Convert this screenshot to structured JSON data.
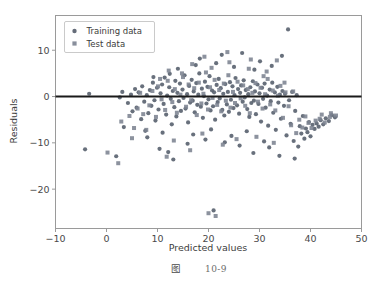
{
  "figure": {
    "caption_label": "图",
    "caption_number": "10-9",
    "background_color": "#ffffff"
  },
  "chart_data": {
    "type": "scatter",
    "title": "",
    "xlabel": "Predicted values",
    "ylabel": "Residuals",
    "xlim": [
      -10,
      50
    ],
    "ylim": [
      -28.5,
      17.5
    ],
    "xticks": [
      -10,
      0,
      10,
      20,
      30,
      40,
      50
    ],
    "xticklabels": [
      "−10",
      "0",
      "10",
      "20",
      "30",
      "40",
      "50"
    ],
    "yticks": [
      10,
      0,
      -10,
      -20
    ],
    "yticklabels": [
      "10",
      "0",
      "−10",
      "−20"
    ],
    "grid": false,
    "legend_position": "upper left",
    "reference_line": {
      "orientation": "horizontal",
      "y": 0,
      "color": "#1a1a1a",
      "width": 2
    },
    "series": [
      {
        "name": "Training data",
        "marker": "circle",
        "color": "#58606e",
        "size": 4.2,
        "points": [
          [
            -4.2,
            -11.4
          ],
          [
            -3.4,
            0.6
          ],
          [
            1.9,
            -12.9
          ],
          [
            2.6,
            -0.2
          ],
          [
            3.1,
            1.0
          ],
          [
            3.4,
            -6.6
          ],
          [
            4.2,
            -1.4
          ],
          [
            4.8,
            0.4
          ],
          [
            5.1,
            -3.2
          ],
          [
            5.6,
            1.6
          ],
          [
            5.9,
            -2.4
          ],
          [
            6.3,
            0.9
          ],
          [
            6.8,
            -4.9
          ],
          [
            7.0,
            2.2
          ],
          [
            7.4,
            -1.1
          ],
          [
            7.6,
            -7.4
          ],
          [
            7.9,
            0.3
          ],
          [
            8.2,
            -3.6
          ],
          [
            8.5,
            1.4
          ],
          [
            8.8,
            -2.0
          ],
          [
            9.1,
            3.0
          ],
          [
            9.4,
            -0.8
          ],
          [
            9.6,
            -5.2
          ],
          [
            9.9,
            1.9
          ],
          [
            10.2,
            -2.8
          ],
          [
            10.4,
            -11.3
          ],
          [
            10.6,
            0.7
          ],
          [
            10.9,
            2.6
          ],
          [
            11.2,
            -1.6
          ],
          [
            11.4,
            4.1
          ],
          [
            11.7,
            -3.9
          ],
          [
            11.9,
            0.2
          ],
          [
            12.1,
            -12.0
          ],
          [
            12.3,
            2.0
          ],
          [
            12.6,
            -0.5
          ],
          [
            12.8,
            -6.0
          ],
          [
            13.0,
            1.2
          ],
          [
            13.3,
            -2.3
          ],
          [
            13.5,
            3.4
          ],
          [
            13.7,
            -4.3
          ],
          [
            13.9,
            0.8
          ],
          [
            14.2,
            -1.0
          ],
          [
            14.4,
            2.8
          ],
          [
            14.6,
            -3.1
          ],
          [
            14.9,
            1.5
          ],
          [
            15.1,
            -0.3
          ],
          [
            15.3,
            4.6
          ],
          [
            15.5,
            -2.6
          ],
          [
            15.8,
            0.5
          ],
          [
            16.0,
            -5.6
          ],
          [
            16.2,
            2.3
          ],
          [
            16.4,
            -1.3
          ],
          [
            16.7,
            3.6
          ],
          [
            16.9,
            -0.9
          ],
          [
            17.1,
            1.1
          ],
          [
            17.3,
            -3.4
          ],
          [
            17.6,
            2.9
          ],
          [
            17.8,
            -1.8
          ],
          [
            18.0,
            0.4
          ],
          [
            18.2,
            5.0
          ],
          [
            18.5,
            -2.2
          ],
          [
            18.7,
            1.7
          ],
          [
            18.9,
            -4.6
          ],
          [
            19.1,
            0.1
          ],
          [
            19.3,
            3.2
          ],
          [
            19.6,
            -1.5
          ],
          [
            19.8,
            2.1
          ],
          [
            20.0,
            -0.6
          ],
          [
            20.2,
            4.4
          ],
          [
            20.4,
            -3.0
          ],
          [
            20.7,
            1.3
          ],
          [
            20.9,
            -2.1
          ],
          [
            21.1,
            0.9
          ],
          [
            21.3,
            -5.0
          ],
          [
            21.6,
            2.5
          ],
          [
            21.8,
            -1.2
          ],
          [
            22.0,
            3.8
          ],
          [
            22.2,
            -0.4
          ],
          [
            22.4,
            1.8
          ],
          [
            22.7,
            -2.9
          ],
          [
            22.9,
            0.6
          ],
          [
            23.1,
            -4.1
          ],
          [
            23.3,
            2.7
          ],
          [
            23.6,
            -1.7
          ],
          [
            23.8,
            1.0
          ],
          [
            24.0,
            -3.3
          ],
          [
            24.2,
            3.1
          ],
          [
            24.4,
            -0.7
          ],
          [
            24.7,
            2.2
          ],
          [
            24.9,
            -2.5
          ],
          [
            25.1,
            0.3
          ],
          [
            25.3,
            4.0
          ],
          [
            25.6,
            -1.9
          ],
          [
            25.8,
            1.6
          ],
          [
            26.0,
            -3.7
          ],
          [
            26.2,
            0.8
          ],
          [
            26.4,
            2.4
          ],
          [
            26.7,
            -1.1
          ],
          [
            26.9,
            3.5
          ],
          [
            27.1,
            -0.2
          ],
          [
            27.3,
            1.4
          ],
          [
            27.6,
            -2.7
          ],
          [
            27.8,
            0.5
          ],
          [
            28.0,
            -4.4
          ],
          [
            28.2,
            2.0
          ],
          [
            28.4,
            -1.4
          ],
          [
            28.7,
            3.3
          ],
          [
            28.9,
            -0.9
          ],
          [
            29.1,
            1.1
          ],
          [
            29.3,
            -3.8
          ],
          [
            29.6,
            2.6
          ],
          [
            29.8,
            -1.6
          ],
          [
            30.0,
            0.7
          ],
          [
            30.3,
            -5.4
          ],
          [
            30.5,
            1.9
          ],
          [
            30.7,
            -0.5
          ],
          [
            31.0,
            2.8
          ],
          [
            31.2,
            -2.4
          ],
          [
            31.5,
            0.2
          ],
          [
            31.7,
            -6.3
          ],
          [
            32.0,
            1.5
          ],
          [
            32.2,
            -1.0
          ],
          [
            32.5,
            3.0
          ],
          [
            32.7,
            -3.5
          ],
          [
            33.0,
            0.9
          ],
          [
            33.2,
            -7.2
          ],
          [
            33.5,
            2.1
          ],
          [
            33.7,
            -1.3
          ],
          [
            34.0,
            0.4
          ],
          [
            34.2,
            -4.8
          ],
          [
            34.5,
            1.2
          ],
          [
            34.8,
            -2.0
          ],
          [
            35.0,
            0.6
          ],
          [
            35.3,
            -8.4
          ],
          [
            35.6,
            14.5
          ],
          [
            35.8,
            -0.8
          ],
          [
            36.1,
            -5.9
          ],
          [
            36.4,
            1.0
          ],
          [
            36.7,
            -9.6
          ],
          [
            37.0,
            -3.1
          ],
          [
            37.3,
            0.3
          ],
          [
            37.6,
            -10.8
          ],
          [
            37.9,
            -6.4
          ],
          [
            38.2,
            -8.0
          ],
          [
            38.5,
            -4.2
          ],
          [
            38.8,
            -9.1
          ],
          [
            39.1,
            -6.9
          ],
          [
            39.4,
            -7.7
          ],
          [
            39.7,
            -5.5
          ],
          [
            40.0,
            -8.6
          ],
          [
            40.4,
            -6.1
          ],
          [
            40.8,
            -7.0
          ],
          [
            41.2,
            -5.8
          ],
          [
            41.6,
            -6.5
          ],
          [
            42.0,
            -5.1
          ],
          [
            42.5,
            -6.0
          ],
          [
            43.0,
            -4.7
          ],
          [
            43.6,
            -5.3
          ],
          [
            44.2,
            -4.0
          ],
          [
            44.8,
            -4.5
          ],
          [
            13.1,
            -13.6
          ],
          [
            15.9,
            -10.2
          ],
          [
            19.4,
            -9.3
          ],
          [
            23.2,
            -9.9
          ],
          [
            26.1,
            -10.6
          ],
          [
            28.8,
            -12.2
          ],
          [
            31.9,
            -11.0
          ],
          [
            21.0,
            -24.6
          ],
          [
            8.0,
            -8.8
          ],
          [
            11.0,
            -7.8
          ],
          [
            17.0,
            -8.2
          ],
          [
            20.5,
            -7.1
          ],
          [
            24.5,
            -8.5
          ],
          [
            27.5,
            -7.5
          ],
          [
            30.9,
            -9.7
          ],
          [
            33.9,
            -12.8
          ],
          [
            36.9,
            -13.4
          ],
          [
            14.0,
            6.0
          ],
          [
            17.5,
            6.8
          ],
          [
            21.5,
            7.2
          ],
          [
            25.0,
            6.4
          ],
          [
            29.0,
            5.8
          ],
          [
            32.4,
            6.6
          ],
          [
            34.4,
            8.8
          ],
          [
            22.6,
            9.0
          ],
          [
            18.3,
            8.2
          ],
          [
            26.6,
            9.4
          ],
          [
            30.1,
            7.6
          ],
          [
            12.4,
            4.9
          ],
          [
            9.2,
            4.2
          ]
        ]
      },
      {
        "name": "Test data",
        "marker": "square",
        "color": "#7c8391",
        "size": 4.0,
        "points": [
          [
            0.2,
            -12.1
          ],
          [
            2.9,
            -5.4
          ],
          [
            4.5,
            -4.2
          ],
          [
            5.4,
            -6.8
          ],
          [
            6.1,
            -2.6
          ],
          [
            6.6,
            0.8
          ],
          [
            7.2,
            -3.8
          ],
          [
            8.4,
            -1.9
          ],
          [
            9.0,
            1.2
          ],
          [
            9.7,
            -4.4
          ],
          [
            10.1,
            2.2
          ],
          [
            10.8,
            -0.6
          ],
          [
            11.5,
            -2.9
          ],
          [
            12.0,
            3.4
          ],
          [
            12.9,
            -1.2
          ],
          [
            13.4,
            1.6
          ],
          [
            13.8,
            -3.5
          ],
          [
            14.5,
            0.4
          ],
          [
            15.0,
            4.2
          ],
          [
            15.6,
            -2.2
          ],
          [
            16.1,
            2.6
          ],
          [
            16.6,
            -0.8
          ],
          [
            17.2,
            1.8
          ],
          [
            17.7,
            -4.0
          ],
          [
            18.1,
            3.0
          ],
          [
            18.6,
            -1.5
          ],
          [
            19.0,
            0.6
          ],
          [
            19.5,
            5.2
          ],
          [
            19.9,
            -2.8
          ],
          [
            20.3,
            2.0
          ],
          [
            20.8,
            -0.3
          ],
          [
            21.2,
            3.6
          ],
          [
            21.7,
            -1.8
          ],
          [
            22.1,
            1.4
          ],
          [
            22.5,
            -3.2
          ],
          [
            23.0,
            2.8
          ],
          [
            23.4,
            -0.9
          ],
          [
            23.9,
            4.6
          ],
          [
            24.3,
            -2.4
          ],
          [
            24.8,
            1.0
          ],
          [
            25.2,
            -1.4
          ],
          [
            25.7,
            3.2
          ],
          [
            26.3,
            -0.4
          ],
          [
            26.8,
            2.4
          ],
          [
            27.2,
            -2.0
          ],
          [
            27.7,
            1.6
          ],
          [
            28.1,
            -3.6
          ],
          [
            28.6,
            0.8
          ],
          [
            29.2,
            2.9
          ],
          [
            29.7,
            -1.1
          ],
          [
            30.2,
            1.9
          ],
          [
            30.6,
            -2.6
          ],
          [
            31.1,
            0.5
          ],
          [
            31.6,
            3.8
          ],
          [
            32.1,
            -1.7
          ],
          [
            32.6,
            1.3
          ],
          [
            33.1,
            -3.0
          ],
          [
            33.6,
            0.2
          ],
          [
            34.1,
            2.3
          ],
          [
            34.6,
            -4.6
          ],
          [
            35.1,
            0.9
          ],
          [
            35.7,
            -2.1
          ],
          [
            36.2,
            -6.2
          ],
          [
            36.6,
            1.1
          ],
          [
            37.2,
            -7.9
          ],
          [
            37.8,
            -5.0
          ],
          [
            38.4,
            -6.7
          ],
          [
            39.0,
            -4.3
          ],
          [
            39.6,
            -5.7
          ],
          [
            40.2,
            -6.8
          ],
          [
            41.0,
            -5.2
          ],
          [
            41.8,
            -4.8
          ],
          [
            42.8,
            -5.6
          ],
          [
            43.8,
            -4.4
          ],
          [
            45.0,
            -4.1
          ],
          [
            2.3,
            -14.4
          ],
          [
            11.8,
            -13.0
          ],
          [
            16.4,
            -11.6
          ],
          [
            22.8,
            -10.4
          ],
          [
            20.0,
            -25.2
          ],
          [
            21.4,
            -25.8
          ],
          [
            5.0,
            -9.0
          ],
          [
            7.8,
            -7.2
          ],
          [
            13.2,
            -9.5
          ],
          [
            18.8,
            -8.0
          ],
          [
            25.5,
            -9.2
          ],
          [
            29.4,
            -8.7
          ],
          [
            32.8,
            -10.0
          ],
          [
            12.2,
            5.6
          ],
          [
            16.8,
            7.0
          ],
          [
            20.6,
            6.2
          ],
          [
            24.1,
            7.4
          ],
          [
            27.9,
            6.0
          ],
          [
            31.4,
            5.4
          ],
          [
            33.4,
            7.8
          ],
          [
            23.7,
            9.6
          ],
          [
            19.2,
            8.6
          ],
          [
            28.3,
            8.0
          ],
          [
            14.8,
            5.0
          ],
          [
            10.5,
            3.8
          ],
          [
            30.8,
            4.4
          ],
          [
            34.9,
            3.0
          ],
          [
            44.0,
            -3.6
          ],
          [
            42.2,
            -3.9
          ]
        ]
      }
    ]
  },
  "legend": {
    "entries": [
      {
        "label": "Training data",
        "marker": "circle",
        "color": "#58606e"
      },
      {
        "label": "Test data",
        "marker": "square",
        "color": "#7c8391"
      }
    ]
  }
}
